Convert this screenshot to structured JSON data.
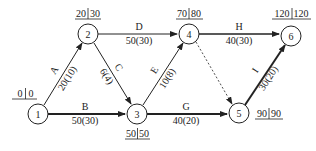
{
  "diagram": {
    "type": "activity-on-arrow network",
    "nodes": [
      {
        "id": "1",
        "label": "1",
        "times": [
          "0",
          "0"
        ]
      },
      {
        "id": "2",
        "label": "2",
        "times": [
          "20",
          "30"
        ]
      },
      {
        "id": "3",
        "label": "3",
        "times": [
          "50",
          "50"
        ]
      },
      {
        "id": "4",
        "label": "4",
        "times": [
          "70",
          "80"
        ]
      },
      {
        "id": "5",
        "label": "5",
        "times": [
          "90",
          "90"
        ]
      },
      {
        "id": "6",
        "label": "6",
        "times": [
          "120",
          "120"
        ]
      }
    ],
    "edges": [
      {
        "id": "A",
        "from": "1",
        "to": "2",
        "name": "A",
        "duration": "20(10)",
        "critical": false
      },
      {
        "id": "B",
        "from": "1",
        "to": "3",
        "name": "B",
        "duration": "50(30)",
        "critical": true
      },
      {
        "id": "C",
        "from": "2",
        "to": "3",
        "name": "C",
        "duration": "6(4)",
        "critical": false
      },
      {
        "id": "D",
        "from": "2",
        "to": "4",
        "name": "D",
        "duration": "50(30)",
        "critical": false
      },
      {
        "id": "E",
        "from": "3",
        "to": "4",
        "name": "E",
        "duration": "10(8)",
        "critical": false
      },
      {
        "id": "G",
        "from": "3",
        "to": "5",
        "name": "G",
        "duration": "40(20)",
        "critical": true
      },
      {
        "id": "H",
        "from": "4",
        "to": "6",
        "name": "H",
        "duration": "40(30)",
        "critical": false
      },
      {
        "id": "dummy",
        "from": "4",
        "to": "5",
        "name": "",
        "duration": "",
        "critical": false,
        "dashed": true
      },
      {
        "id": "I",
        "from": "5",
        "to": "6",
        "name": "I",
        "duration": "30(20)",
        "critical": true
      }
    ]
  }
}
